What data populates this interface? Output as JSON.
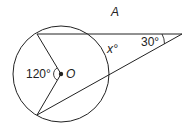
{
  "figure": {
    "label": "A",
    "center_label": "O",
    "central_angle": "120°",
    "exterior_angle": "30°",
    "unknown_angle_var": "x",
    "unknown_angle": "x°"
  },
  "colors": {
    "stroke": "#222222",
    "background": "#ffffff"
  }
}
